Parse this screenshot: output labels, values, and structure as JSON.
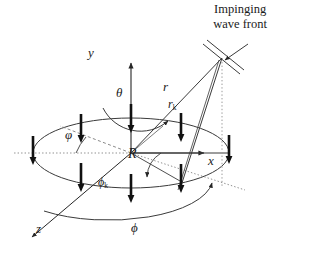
{
  "figure": {
    "background": "#ffffff",
    "line_color": "#262626",
    "dotted_color": "#8a8a8a",
    "element_color": "#111111"
  },
  "caption": {
    "impinging_line1": "Impinging",
    "impinging_line2": "wave front"
  },
  "axes": [
    {
      "name": "y-axis",
      "label": "y",
      "direction": "up",
      "style": "solid-arrow"
    },
    {
      "name": "x-axis",
      "label": "x",
      "direction": "right",
      "style": "solid-arrow"
    },
    {
      "name": "z-axis",
      "label": "z",
      "direction": "down-left",
      "style": "solid-arrow"
    }
  ],
  "angles": [
    {
      "name": "theta",
      "label": "θ",
      "description": "elevation angle measured from y-axis"
    },
    {
      "name": "varphi",
      "label": "φ",
      "description": "angle in array plane to element"
    },
    {
      "name": "phi-k",
      "label": "ϕ",
      "sub": "k",
      "description": "azimuth angle of k-th element"
    },
    {
      "name": "phi",
      "label": "ϕ",
      "description": "azimuth angle of incoming wave"
    }
  ],
  "vectors": [
    {
      "name": "r",
      "label": "r",
      "description": "distance from origin to wave front"
    },
    {
      "name": "r-k",
      "label": "r",
      "sub": "k",
      "description": "position vector of k-th array element"
    }
  ],
  "dimensions": [
    {
      "name": "radius",
      "label": "R",
      "description": "array radius"
    }
  ],
  "array": {
    "element_count": 8,
    "element_glyph": "vertical-bar-with-down-arrow",
    "elements": [
      {
        "index": 1,
        "x": 131,
        "y": 118
      },
      {
        "index": 2,
        "x": 81,
        "y": 128
      },
      {
        "index": 3,
        "x": 33,
        "y": 150
      },
      {
        "index": 4,
        "x": 81,
        "y": 177
      },
      {
        "index": 5,
        "x": 131,
        "y": 188
      },
      {
        "index": 6,
        "x": 181,
        "y": 178
      },
      {
        "index": 7,
        "x": 229,
        "y": 150
      },
      {
        "index": 8,
        "x": 181,
        "y": 126
      }
    ]
  },
  "wavefront": {
    "name": "plane-wave-front",
    "glyph": "two-parallel-slanted-lines-with-arrow",
    "arrow_direction": "down-left"
  }
}
